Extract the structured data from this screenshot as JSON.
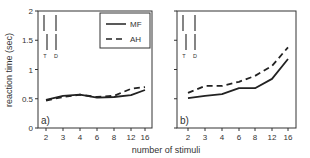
{
  "figure": {
    "ylabel": "reaction time (sec)",
    "xlabel": "number of stimuli",
    "yticks": [
      "0",
      "0.5",
      "1",
      "1.5",
      "2"
    ],
    "xticks": [
      "2",
      "3",
      "4",
      "6",
      "8",
      "12",
      "16"
    ],
    "legend": {
      "mf": "MF",
      "ah": "AH"
    },
    "markers": {
      "t": "T",
      "d": "D"
    },
    "panels": [
      {
        "label": "a)"
      },
      {
        "label": "b)"
      }
    ]
  },
  "chart_data": [
    {
      "type": "line",
      "title": "a)",
      "xlabel": "number of stimuli",
      "ylabel": "reaction time (sec)",
      "categories": [
        2,
        3,
        4,
        6,
        8,
        12,
        16
      ],
      "ylim": [
        0,
        2
      ],
      "yticks": [
        0,
        0.5,
        1,
        1.5,
        2
      ],
      "grid": false,
      "legend_position": "upper right",
      "annotations": [
        "T",
        "D"
      ],
      "series": [
        {
          "name": "MF",
          "style": "solid",
          "values": [
            0.48,
            0.55,
            0.57,
            0.52,
            0.53,
            0.56,
            0.65
          ]
        },
        {
          "name": "AH",
          "style": "dashed",
          "values": [
            0.47,
            0.53,
            0.57,
            0.53,
            0.55,
            0.67,
            0.7
          ]
        }
      ]
    },
    {
      "type": "line",
      "title": "b)",
      "xlabel": "number of stimuli",
      "ylabel": "reaction time (sec)",
      "categories": [
        2,
        3,
        4,
        6,
        8,
        12,
        16
      ],
      "ylim": [
        0,
        2
      ],
      "yticks": [
        0,
        0.5,
        1,
        1.5,
        2
      ],
      "grid": false,
      "annotations": [
        "T",
        "D"
      ],
      "series": [
        {
          "name": "MF",
          "style": "solid",
          "values": [
            0.51,
            0.55,
            0.58,
            0.68,
            0.68,
            0.84,
            1.18
          ]
        },
        {
          "name": "AH",
          "style": "dashed",
          "values": [
            0.6,
            0.72,
            0.72,
            0.79,
            0.89,
            1.06,
            1.38
          ]
        }
      ]
    }
  ]
}
